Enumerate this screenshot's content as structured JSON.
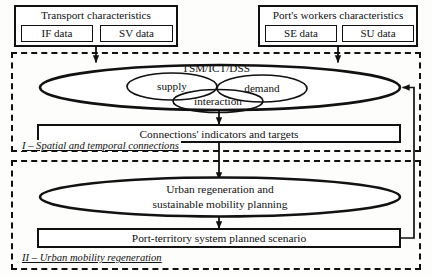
{
  "diagram": {
    "sources": [
      {
        "id": "transport",
        "title": "Transport characteristics",
        "items": [
          {
            "id": "if",
            "label": "IF data"
          },
          {
            "id": "sv",
            "label": "SV data"
          }
        ]
      },
      {
        "id": "port-workers",
        "title": "Port's workers characteristics",
        "items": [
          {
            "id": "se",
            "label": "SE data"
          },
          {
            "id": "su",
            "label": "SU data"
          }
        ]
      }
    ],
    "sections": [
      {
        "id": "section-1",
        "label": "I – Spatial and temporal connections"
      },
      {
        "id": "section-2",
        "label": "II – Urban mobility regeneration"
      }
    ],
    "nodes": {
      "tsm": "TSM/ICT/DSS",
      "supply": "supply",
      "demand": "demand",
      "interaction": "interaction",
      "connections": "Connections' indicators and targets",
      "urban_line1": "Urban regeneration and",
      "urban_line2": "sustainable mobility planning",
      "scenario": "Port-territory system planned scenario"
    },
    "colors": {
      "stroke": "#111111",
      "background": "#fdfdfb",
      "fill": "#ffffff"
    }
  }
}
